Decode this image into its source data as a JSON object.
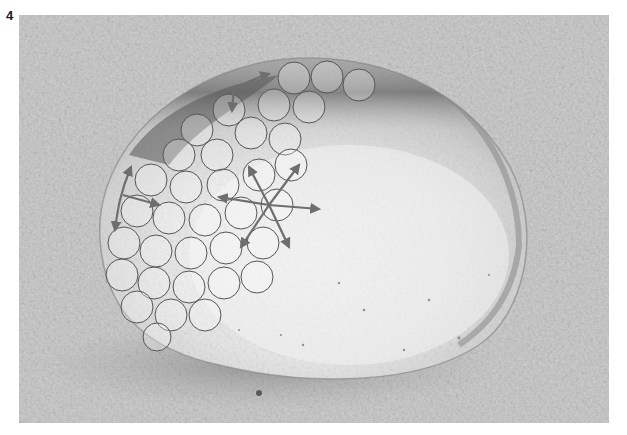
{
  "figure": {
    "label": "4",
    "overlay": "close-packed water molecules with cohesive force arrows",
    "colors": {
      "background_surface": "#c8c8c8",
      "droplet_highlight": "#eeeeee",
      "droplet_shadow": "#7a7a7a",
      "molecule_outline": "#555555",
      "arrow_color": "#6e6e6e"
    }
  }
}
